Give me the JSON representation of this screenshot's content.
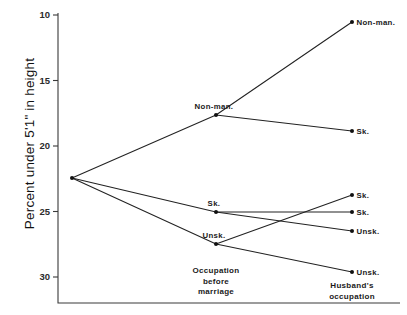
{
  "chart_data": {
    "type": "line",
    "title": "",
    "subtitle": "",
    "xlabel": "",
    "ylabel": "Percent under 5'1\" in height",
    "ylim": [
      10,
      31.5
    ],
    "y_inverted": true,
    "grid": false,
    "legend_position": "none",
    "yticks": [
      10,
      15,
      20,
      25,
      30
    ],
    "ytick_labels": [
      "10",
      "15",
      "20",
      "25",
      "30"
    ],
    "stage_labels": [
      {
        "id": "stage-origin",
        "text": "",
        "lines": []
      },
      {
        "id": "stage-before-marriage",
        "text": "Occupation before marriage",
        "lines": [
          "Occupation",
          "before",
          "marriage"
        ]
      },
      {
        "id": "stage-husband",
        "text": "Husband's occupation",
        "lines": [
          "Husband's",
          "occupation"
        ]
      }
    ],
    "nodes": [
      {
        "id": "root",
        "stage": 0,
        "label": "",
        "value": 22.5,
        "px": 72,
        "py": 178,
        "label_pos": "none"
      },
      {
        "id": "mid-nonman",
        "stage": 1,
        "label": "Non-man.",
        "value": 17.6,
        "px": 216,
        "py": 115,
        "label_pos": "above-left"
      },
      {
        "id": "mid-sk",
        "stage": 1,
        "label": "Sk.",
        "value": 25.0,
        "px": 216,
        "py": 212,
        "label_pos": "above-left"
      },
      {
        "id": "mid-unsk",
        "stage": 1,
        "label": "Unsk.",
        "value": 27.5,
        "px": 216,
        "py": 244,
        "label_pos": "above-left"
      },
      {
        "id": "end-nonman",
        "stage": 2,
        "label": "Non-man.",
        "value": 10.5,
        "px": 352,
        "py": 22,
        "label_pos": "right"
      },
      {
        "id": "end-sk-from-nonman",
        "stage": 2,
        "label": "Sk.",
        "value": 19.9,
        "px": 352,
        "py": 131,
        "label_pos": "right"
      },
      {
        "id": "end-sk-from-unsk",
        "stage": 2,
        "label": "Sk.",
        "value": 23.7,
        "px": 352,
        "py": 195,
        "label_pos": "right"
      },
      {
        "id": "end-sk-from-sk",
        "stage": 2,
        "label": "Sk.",
        "value": 25.0,
        "px": 352,
        "py": 212,
        "label_pos": "right"
      },
      {
        "id": "end-unsk-from-sk",
        "stage": 2,
        "label": "Unsk.",
        "value": 26.5,
        "px": 352,
        "py": 231,
        "label_pos": "right"
      },
      {
        "id": "end-unsk-from-unsk",
        "stage": 2,
        "label": "Unsk.",
        "value": 29.6,
        "px": 352,
        "py": 272,
        "label_pos": "right"
      }
    ],
    "links": [
      {
        "from": "root",
        "to": "mid-nonman"
      },
      {
        "from": "root",
        "to": "mid-sk"
      },
      {
        "from": "root",
        "to": "mid-unsk"
      },
      {
        "from": "mid-nonman",
        "to": "end-nonman"
      },
      {
        "from": "mid-nonman",
        "to": "end-sk-from-nonman"
      },
      {
        "from": "mid-sk",
        "to": "end-sk-from-sk"
      },
      {
        "from": "mid-sk",
        "to": "end-unsk-from-sk"
      },
      {
        "from": "mid-unsk",
        "to": "end-sk-from-unsk"
      },
      {
        "from": "mid-unsk",
        "to": "end-unsk-from-unsk"
      }
    ],
    "colors": {
      "line": "#222222",
      "node": "#111111",
      "axis": "#3a3a3a",
      "text": "#111111",
      "background": "#ffffff"
    }
  },
  "axis": {
    "y_title": "Percent under 5'1\" in height"
  }
}
